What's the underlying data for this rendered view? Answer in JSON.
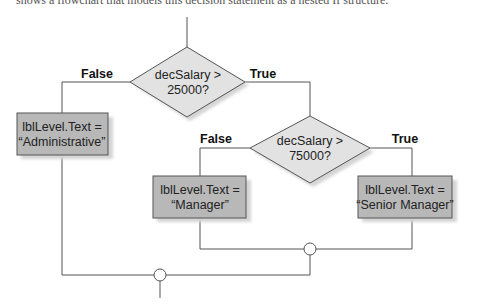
{
  "caption": "shows a flowchart that models this decision statement as a nested If structure.",
  "flowchart": {
    "decisions": [
      {
        "id": "d1",
        "line1": "decSalary >",
        "line2": "25000?",
        "false_label": "False",
        "true_label": "True"
      },
      {
        "id": "d2",
        "line1": "decSalary >",
        "line2": "75000?",
        "false_label": "False",
        "true_label": "True"
      }
    ],
    "processes": [
      {
        "id": "p1",
        "line1": "lblLevel.Text =",
        "line2": "“Administrative”"
      },
      {
        "id": "p2",
        "line1": "lblLevel.Text =",
        "line2": "“Manager”"
      },
      {
        "id": "p3",
        "line1": "lblLevel.Text =",
        "line2": "“Senior Manager”"
      }
    ],
    "colors": {
      "process_fill": "#b8b8b8",
      "decision_fill": "#e2e2e2",
      "shadow": "#d4d4d4",
      "line": "#555555"
    }
  }
}
